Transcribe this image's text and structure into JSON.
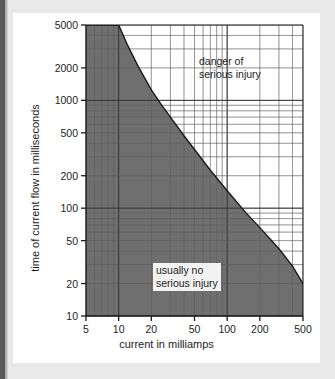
{
  "page": {
    "background_color": "#e9e9e9",
    "card_color": "#ffffff",
    "accent_bar_color": "#5a5a5a"
  },
  "chart_data": {
    "type": "line",
    "title": "",
    "xlabel": "current in milliamps",
    "ylabel": "time of current flow in milliseconds",
    "xscale": "log",
    "yscale": "log",
    "xlim": [
      5,
      500
    ],
    "ylim": [
      10,
      5000
    ],
    "grid": true,
    "legend_position": "none",
    "xticks": [
      5,
      10,
      20,
      50,
      100,
      200,
      500
    ],
    "xtick_labels": [
      "5",
      "10",
      "20",
      "50",
      "100",
      "200",
      "500"
    ],
    "yticks": [
      10,
      20,
      50,
      100,
      200,
      500,
      1000,
      2000,
      5000
    ],
    "ytick_labels": [
      "10",
      "20",
      "50",
      "100",
      "200",
      "500",
      "1000",
      "2000",
      "5000"
    ],
    "series": [
      {
        "name": "injury threshold",
        "fill": "below",
        "fill_color": "#6f6f6f",
        "line_color": "#1a1a1a",
        "x": [
          5,
          10,
          12,
          15,
          20,
          25,
          30,
          40,
          50,
          70,
          100,
          150,
          200,
          300,
          400,
          500
        ],
        "y": [
          5000,
          5000,
          3300,
          2100,
          1250,
          900,
          700,
          470,
          350,
          225,
          145,
          90,
          66,
          42,
          29,
          20
        ]
      }
    ],
    "annotations": [
      {
        "name": "danger-region-note",
        "text_line1": "danger of",
        "text_line2": "serious injury",
        "x": 95,
        "y": 1800,
        "boxed": false
      },
      {
        "name": "safe-region-note",
        "text_line1": "usually no",
        "text_line2": "serious injury",
        "x": 20,
        "y": 32,
        "boxed": true
      }
    ]
  }
}
